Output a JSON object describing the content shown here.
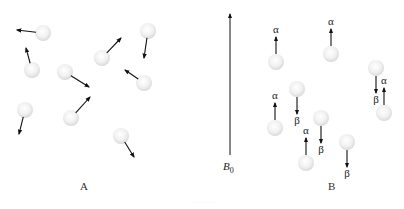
{
  "panels": {
    "A": {
      "label": "A",
      "label_pos": [
        80,
        190
      ],
      "nuclei": [
        {
          "cx": 43,
          "cy": 33,
          "ax": 17,
          "ay": 30
        },
        {
          "cx": 32,
          "cy": 70,
          "ax": 26,
          "ay": 48
        },
        {
          "cx": 65,
          "cy": 72,
          "ax": 89,
          "ay": 87
        },
        {
          "cx": 102,
          "cy": 58,
          "ax": 121,
          "ay": 38
        },
        {
          "cx": 148,
          "cy": 31,
          "ax": 144,
          "ay": 58
        },
        {
          "cx": 144,
          "cy": 83,
          "ax": 125,
          "ay": 70
        },
        {
          "cx": 25,
          "cy": 110,
          "ax": 19,
          "ay": 134
        },
        {
          "cx": 71,
          "cy": 118,
          "ax": 90,
          "ay": 97
        },
        {
          "cx": 121,
          "cy": 136,
          "ax": 134,
          "ay": 157
        }
      ]
    },
    "B": {
      "label": "B",
      "label_pos": [
        328,
        190
      ],
      "field_arrow": {
        "x": 230,
        "y1": 14,
        "y2": 155,
        "label": "B",
        "subscript": "0",
        "label_pos": [
          229,
          170
        ]
      },
      "nuclei": [
        {
          "cx": 276,
          "cy": 62,
          "dir": "up",
          "spin": "α"
        },
        {
          "cx": 331,
          "cy": 54,
          "dir": "up",
          "spin": "α"
        },
        {
          "cx": 376,
          "cy": 68,
          "dir": "down",
          "spin": "β"
        },
        {
          "cx": 384,
          "cy": 113,
          "dir": "up",
          "spin": "α"
        },
        {
          "cx": 297,
          "cy": 89,
          "dir": "down",
          "spin": "β"
        },
        {
          "cx": 275,
          "cy": 128,
          "dir": "up",
          "spin": "α"
        },
        {
          "cx": 321,
          "cy": 118,
          "dir": "down",
          "spin": "β"
        },
        {
          "cx": 306,
          "cy": 163,
          "dir": "up",
          "spin": "α"
        },
        {
          "cx": 347,
          "cy": 142,
          "dir": "down",
          "spin": "β"
        }
      ]
    }
  },
  "caption": "· · · · · · · ·"
}
